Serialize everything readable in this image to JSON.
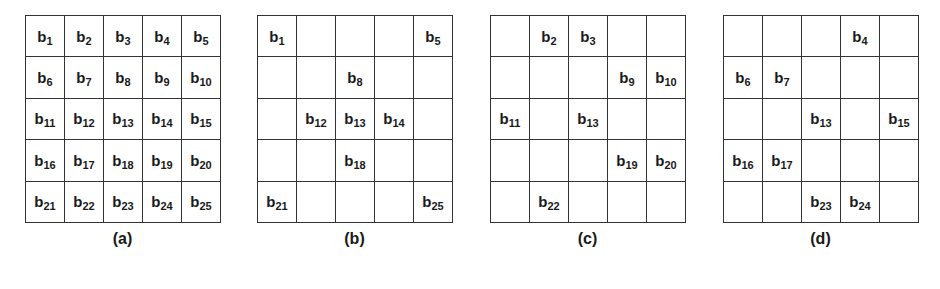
{
  "figure": {
    "panels": [
      {
        "caption": "(a)",
        "cells": [
          "1",
          "2",
          "3",
          "4",
          "5",
          "6",
          "7",
          "8",
          "9",
          "10",
          "11",
          "12",
          "13",
          "14",
          "15",
          "16",
          "17",
          "18",
          "19",
          "20",
          "21",
          "22",
          "23",
          "24",
          "25"
        ]
      },
      {
        "caption": "(b)",
        "cells": [
          "1",
          "",
          "",
          "",
          "5",
          "",
          "",
          "8",
          "",
          "",
          "",
          "12",
          "13",
          "14",
          "",
          "",
          "",
          "18",
          "",
          "",
          "21",
          "",
          "",
          "",
          "25"
        ]
      },
      {
        "caption": "(c)",
        "cells": [
          "",
          "2",
          "3",
          "",
          "",
          "",
          "",
          "",
          "9",
          "10",
          "11",
          "",
          "13",
          "",
          "",
          "",
          "",
          "",
          "19",
          "20",
          "",
          "22",
          "",
          "",
          ""
        ]
      },
      {
        "caption": "(d)",
        "cells": [
          "",
          "",
          "",
          "4",
          "",
          "6",
          "7",
          "",
          "",
          "",
          "",
          "",
          "13",
          "",
          "15",
          "16",
          "17",
          "",
          "",
          "",
          "",
          "",
          "23",
          "24",
          ""
        ]
      }
    ],
    "cell_prefix": "b"
  }
}
